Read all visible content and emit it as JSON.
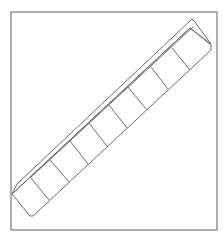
{
  "figure": {
    "compartment_count": 8,
    "colors": {
      "stroke": "#6e6e6e",
      "frame": "#7a7a7a",
      "background": "#ffffff"
    }
  },
  "caption": {
    "text": ""
  }
}
